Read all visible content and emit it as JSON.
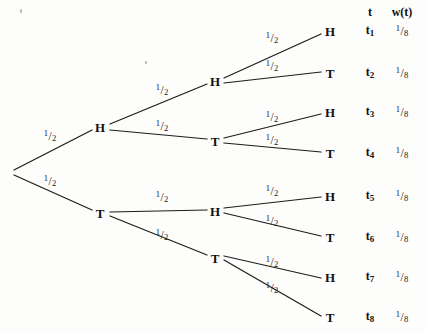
{
  "figure": {
    "name": "probability-tree-three-coin-flips",
    "background_color": "#fdfdfb",
    "edge_color": "#1d1d1d",
    "text_color": "#111111"
  },
  "table_header": {
    "outcome_col": "t",
    "weight_col": "w(t)"
  },
  "branch_weight": {
    "numerator": "1",
    "slash": "/",
    "denominator": "2",
    "text": "1/2"
  },
  "outcome_weight": {
    "numerator": "1",
    "slash": "/",
    "denominator": "8",
    "text": "1/8"
  },
  "nodes": [
    {
      "id": "root",
      "label": "",
      "x": 10,
      "y": 172
    },
    {
      "id": "n-H",
      "label": "H",
      "x": 100,
      "y": 127
    },
    {
      "id": "n-T",
      "label": "T",
      "x": 100,
      "y": 213
    },
    {
      "id": "n-HH",
      "label": "H",
      "x": 215,
      "y": 81
    },
    {
      "id": "n-HT",
      "label": "T",
      "x": 215,
      "y": 141
    },
    {
      "id": "n-TH",
      "label": "H",
      "x": 215,
      "y": 211
    },
    {
      "id": "n-TT",
      "label": "T",
      "x": 215,
      "y": 258
    },
    {
      "id": "leaf-1",
      "label": "H",
      "x": 330,
      "y": 31
    },
    {
      "id": "leaf-2",
      "label": "T",
      "x": 330,
      "y": 73
    },
    {
      "id": "leaf-3",
      "label": "H",
      "x": 330,
      "y": 112
    },
    {
      "id": "leaf-4",
      "label": "T",
      "x": 330,
      "y": 153
    },
    {
      "id": "leaf-5",
      "label": "H",
      "x": 330,
      "y": 196
    },
    {
      "id": "leaf-6",
      "label": "T",
      "x": 330,
      "y": 237
    },
    {
      "id": "leaf-7",
      "label": "H",
      "x": 330,
      "y": 277
    },
    {
      "id": "leaf-8",
      "label": "T",
      "x": 330,
      "y": 317
    }
  ],
  "edges": [
    {
      "from": "root",
      "to": "n-H",
      "x1": 14,
      "y1": 170,
      "x2": 92,
      "y2": 130,
      "label_x": 50,
      "label_y": 136
    },
    {
      "from": "root",
      "to": "n-T",
      "x1": 14,
      "y1": 175,
      "x2": 92,
      "y2": 210,
      "label_x": 50,
      "label_y": 181
    },
    {
      "from": "n-H",
      "to": "n-HH",
      "x1": 110,
      "y1": 124,
      "x2": 207,
      "y2": 84,
      "label_x": 162,
      "label_y": 90
    },
    {
      "from": "n-H",
      "to": "n-HT",
      "x1": 110,
      "y1": 130,
      "x2": 207,
      "y2": 139,
      "label_x": 162,
      "label_y": 126
    },
    {
      "from": "n-T",
      "to": "n-TH",
      "x1": 110,
      "y1": 212,
      "x2": 207,
      "y2": 210,
      "label_x": 162,
      "label_y": 197
    },
    {
      "from": "n-T",
      "to": "n-TT",
      "x1": 110,
      "y1": 216,
      "x2": 207,
      "y2": 255,
      "label_x": 162,
      "label_y": 235
    },
    {
      "from": "n-HH",
      "to": "leaf-1",
      "x1": 224,
      "y1": 78,
      "x2": 321,
      "y2": 34,
      "label_x": 272,
      "label_y": 38
    },
    {
      "from": "n-HH",
      "to": "leaf-2",
      "x1": 224,
      "y1": 83,
      "x2": 321,
      "y2": 72,
      "label_x": 272,
      "label_y": 66
    },
    {
      "from": "n-HT",
      "to": "leaf-3",
      "x1": 224,
      "y1": 138,
      "x2": 321,
      "y2": 114,
      "label_x": 272,
      "label_y": 117
    },
    {
      "from": "n-HT",
      "to": "leaf-4",
      "x1": 224,
      "y1": 143,
      "x2": 321,
      "y2": 152,
      "label_x": 272,
      "label_y": 140
    },
    {
      "from": "n-TH",
      "to": "leaf-5",
      "x1": 224,
      "y1": 208,
      "x2": 321,
      "y2": 197,
      "label_x": 272,
      "label_y": 191
    },
    {
      "from": "n-TH",
      "to": "leaf-6",
      "x1": 224,
      "y1": 213,
      "x2": 321,
      "y2": 236,
      "label_x": 272,
      "label_y": 221
    },
    {
      "from": "n-TT",
      "to": "leaf-7",
      "x1": 224,
      "y1": 256,
      "x2": 321,
      "y2": 278,
      "label_x": 272,
      "label_y": 262
    },
    {
      "from": "n-TT",
      "to": "leaf-8",
      "x1": 224,
      "y1": 260,
      "x2": 321,
      "y2": 316,
      "label_x": 272,
      "label_y": 288
    }
  ],
  "outcomes": [
    {
      "id": "t1",
      "sub": "1",
      "weight": "1/8",
      "y": 31
    },
    {
      "id": "t2",
      "sub": "2",
      "weight": "1/8",
      "y": 73
    },
    {
      "id": "t3",
      "sub": "3",
      "weight": "1/8",
      "y": 112
    },
    {
      "id": "t4",
      "sub": "4",
      "weight": "1/8",
      "y": 153
    },
    {
      "id": "t5",
      "sub": "5",
      "weight": "1/8",
      "y": 196
    },
    {
      "id": "t6",
      "sub": "6",
      "weight": "1/8",
      "y": 237
    },
    {
      "id": "t7",
      "sub": "7",
      "weight": "1/8",
      "y": 277
    },
    {
      "id": "t8",
      "sub": "8",
      "weight": "1/8",
      "y": 317
    }
  ],
  "columns": {
    "outcome_x": 370,
    "weight_x": 402,
    "header_y": 12
  },
  "specks": [
    {
      "x": 20,
      "y": 9,
      "w": 2,
      "h": 4
    },
    {
      "x": 145,
      "y": 61,
      "w": 2,
      "h": 3
    }
  ]
}
